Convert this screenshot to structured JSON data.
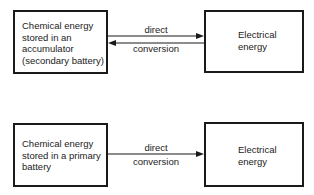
{
  "diagram": {
    "top": {
      "source_box": {
        "text": "Chemical energy\nstored in an\naccumulator\n(secondary battery)"
      },
      "target_box": {
        "text": "Electrical\nenergy"
      },
      "arrow_label_upper": "direct",
      "arrow_label_lower": "conversion",
      "arrows": [
        "forward",
        "backward"
      ]
    },
    "bottom": {
      "source_box": {
        "text": "Chemical energy\nstored in a primary\nbattery"
      },
      "target_box": {
        "text": "Electrical\nenergy"
      },
      "arrow_label_upper": "direct",
      "arrow_label_lower": "conversion",
      "arrows": [
        "forward"
      ]
    },
    "colors": {
      "stroke": "#1a1a1a",
      "background": "#ffffff"
    }
  }
}
